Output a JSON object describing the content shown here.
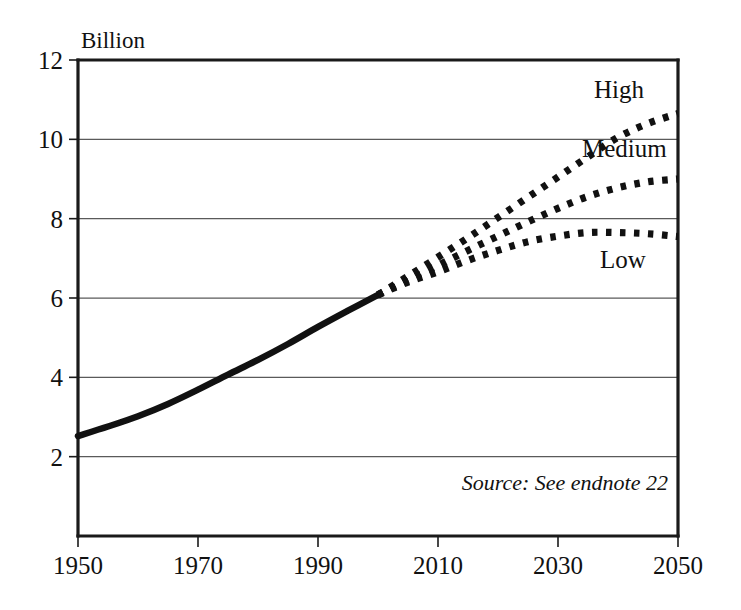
{
  "figure": {
    "unit_label": "Billion",
    "source_note": "Source: See endnote 22"
  },
  "chart_data": {
    "type": "line",
    "title": "",
    "subtitle": "",
    "xlabel": "",
    "ylabel": "Billion",
    "xlim": [
      1950,
      2050
    ],
    "ylim": [
      0,
      12
    ],
    "grid": "horizontal",
    "legend_position": "inline-right",
    "x_ticks": [
      1950,
      1970,
      1990,
      2010,
      2030,
      2050
    ],
    "x_tick_labels": [
      "1950",
      "1970",
      "1990",
      "2010",
      "2030",
      "2050"
    ],
    "y_ticks": [
      2,
      4,
      6,
      8,
      10,
      12
    ],
    "y_tick_labels": [
      "2",
      "4",
      "6",
      "8",
      "10",
      "12"
    ],
    "annotations": [
      {
        "text": "Billion",
        "x": 1951,
        "y": 12.6
      },
      {
        "text": "Source: See endnote 22",
        "x": 2048,
        "y": 1.05
      }
    ],
    "series": [
      {
        "name": "Historical",
        "label": "",
        "style": "solid",
        "color": "#111111",
        "x": [
          1950,
          1955,
          1960,
          1965,
          1970,
          1975,
          1980,
          1985,
          1990,
          1995,
          2000
        ],
        "values": [
          2.52,
          2.76,
          3.02,
          3.33,
          3.69,
          4.07,
          4.44,
          4.84,
          5.27,
          5.68,
          6.08
        ]
      },
      {
        "name": "High",
        "label": "High",
        "style": "dotted",
        "color": "#111111",
        "label_x": 2036,
        "label_y": 11.05,
        "x": [
          2000,
          2005,
          2010,
          2015,
          2020,
          2025,
          2030,
          2035,
          2040,
          2045,
          2050
        ],
        "values": [
          6.08,
          6.55,
          7.03,
          7.52,
          8.03,
          8.54,
          9.05,
          9.56,
          10.05,
          10.4,
          10.65
        ]
      },
      {
        "name": "Medium",
        "label": "Medium",
        "style": "dotted",
        "color": "#111111",
        "label_x": 2034,
        "label_y": 9.55,
        "x": [
          2000,
          2005,
          2010,
          2015,
          2020,
          2025,
          2030,
          2035,
          2040,
          2045,
          2050
        ],
        "values": [
          6.08,
          6.45,
          6.82,
          7.2,
          7.56,
          7.92,
          8.26,
          8.56,
          8.78,
          8.93,
          9.0
        ]
      },
      {
        "name": "Low",
        "label": "Low",
        "style": "dotted",
        "color": "#111111",
        "label_x": 2037,
        "label_y": 6.75,
        "x": [
          2000,
          2005,
          2010,
          2015,
          2020,
          2025,
          2030,
          2035,
          2040,
          2045,
          2050
        ],
        "values": [
          6.08,
          6.4,
          6.66,
          6.95,
          7.2,
          7.42,
          7.56,
          7.65,
          7.65,
          7.62,
          7.55
        ]
      }
    ]
  }
}
